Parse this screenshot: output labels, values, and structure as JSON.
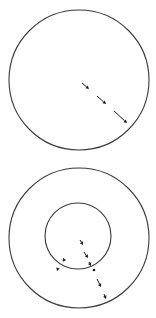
{
  "figure": {
    "width": 156,
    "height": 318,
    "background": "#ffffff",
    "stroke_color": "#3a3a3a",
    "arrow_color": "#1a1a1a"
  },
  "panels": [
    {
      "name": "top-panel",
      "circles": [
        {
          "name": "outer-circle",
          "cx": 79,
          "cy": 80,
          "r": 70
        }
      ],
      "arrows": [
        {
          "name": "arrow-1",
          "x1": 82,
          "y1": 83,
          "x2": 89,
          "y2": 89
        },
        {
          "name": "arrow-2",
          "x1": 97,
          "y1": 96,
          "x2": 106,
          "y2": 104
        },
        {
          "name": "arrow-3",
          "x1": 114,
          "y1": 111,
          "x2": 127,
          "y2": 123
        }
      ]
    },
    {
      "name": "bottom-panel",
      "circles": [
        {
          "name": "outer-circle",
          "cx": 79,
          "cy": 238,
          "r": 70
        },
        {
          "name": "inner-circle",
          "cx": 78,
          "cy": 236,
          "r": 33
        }
      ],
      "arrows": [
        {
          "name": "arrow-inner-1",
          "x1": 80,
          "y1": 240,
          "x2": 83,
          "y2": 245
        },
        {
          "name": "arrow-inner-2",
          "x1": 84,
          "y1": 252,
          "x2": 88,
          "y2": 258
        },
        {
          "name": "arrow-boundary",
          "x1": 89,
          "y1": 262,
          "x2": 91,
          "y2": 266
        },
        {
          "name": "arrow-boundary-out",
          "x1": 94,
          "y1": 270,
          "x2": 94,
          "y2": 270,
          "dot": true
        },
        {
          "name": "arrow-outer-1",
          "x1": 97,
          "y1": 279,
          "x2": 101,
          "y2": 287
        },
        {
          "name": "arrow-outer-2",
          "x1": 104,
          "y1": 294,
          "x2": 106,
          "y2": 299
        },
        {
          "name": "arrow-left-1",
          "x1": 64,
          "y1": 260,
          "x2": 63,
          "y2": 258
        },
        {
          "name": "arrow-left-2",
          "x1": 58,
          "y1": 268,
          "x2": 57,
          "y2": 271
        }
      ]
    }
  ]
}
